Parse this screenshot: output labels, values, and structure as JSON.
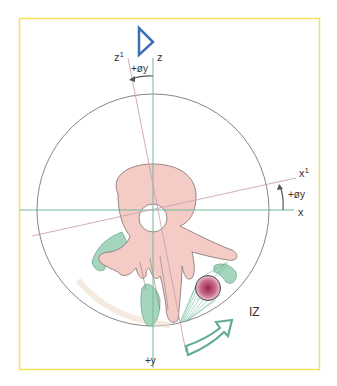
{
  "figure": {
    "frame_color": "#f2e35a",
    "labels": {
      "z": "z",
      "z1": "z",
      "z1_sup": "1",
      "rot_y_top": "+øy",
      "x1": "x",
      "x1_sup": "1",
      "rot_y_right": "+øy",
      "x": "x",
      "plus_y": "+y",
      "iz": "IZ"
    },
    "colors": {
      "axis_green": "#6fb99a",
      "rotated_axis": "#c9a3b3",
      "circle": "#777777",
      "bone": "#f4c9c4",
      "bone_outline": "#8a7c7c",
      "muscle": "#9fd2b9",
      "muscle_outline": "#6fa98e",
      "nerve_fibers": "#5fae8e",
      "nerve_center": "#9a2048",
      "triangle": "#3d6fb5",
      "arrow": "#5fae8e",
      "annotation_arrow": "#555555"
    }
  }
}
